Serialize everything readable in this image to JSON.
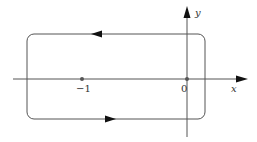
{
  "diagram": {
    "type": "contour-in-complex-plane",
    "axes": {
      "x_label": "x",
      "y_label": "y"
    },
    "points": [
      {
        "name": "minus-one",
        "label": "−1",
        "value": -1
      },
      {
        "name": "origin",
        "label": "0",
        "value": 0
      }
    ],
    "contour": {
      "shape": "rounded-rectangle",
      "orientation": "counterclockwise",
      "top_arrow_direction": "left",
      "bottom_arrow_direction": "right"
    },
    "colors": {
      "stroke": "#555555",
      "arrow": "#111111",
      "point": "#555555"
    }
  }
}
